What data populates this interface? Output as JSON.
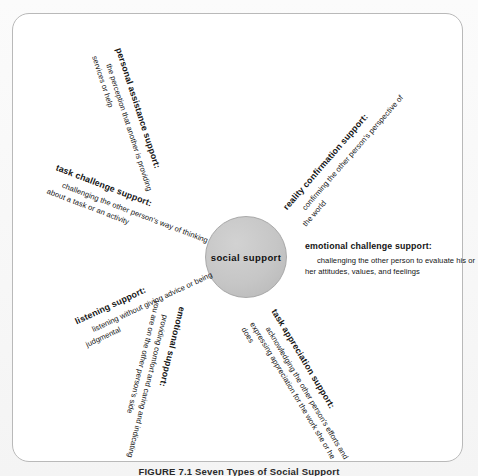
{
  "figure": {
    "center_label": "social support",
    "caption": "FIGURE 7.1  Seven Types of Social Support",
    "panel_border_color": "#b9b9b9",
    "hub_fill_color": "#c6c6c6",
    "text_color": "#141414"
  },
  "chart_data": {
    "type": "diagram",
    "layout": "radial hub-and-spoke",
    "title": "Seven Types of Social Support",
    "center": "social support",
    "spoke_count": 7,
    "spokes": [
      {
        "id": "personal-assistance",
        "term": "personal assistance support:",
        "description": "the perception that another is providing services or help",
        "angle_deg": 72,
        "position": "top"
      },
      {
        "id": "reality-confirmation",
        "term": "reality confirmation support:",
        "description": "confirming the other person's perspective of the world",
        "angle_deg": -49,
        "position": "upper-right"
      },
      {
        "id": "emotional-challenge",
        "term": "emotional challenge support:",
        "description": "challenging the other person to evaluate his or her attitudes, values, and feelings",
        "angle_deg": 0,
        "position": "right"
      },
      {
        "id": "task-appreciation",
        "term": "task appreciation support:",
        "description": "acknowledging the other person's efforts and expressing appreciation for the work she or he does",
        "angle_deg": 59,
        "position": "lower-right"
      },
      {
        "id": "emotional",
        "term": "emotional support:",
        "description": "providing comfort and caring and indicating you are on the other person's side",
        "angle_deg": 104,
        "position": "bottom"
      },
      {
        "id": "listening",
        "term": "listening support:",
        "description": "listening without giving advice or being judgmental",
        "angle_deg": -25,
        "position": "lower-left"
      },
      {
        "id": "task-challenge",
        "term": "task challenge support:",
        "description": "challenging the other person's way of thinking about a task or an activity",
        "angle_deg": 21,
        "position": "upper-left"
      }
    ]
  }
}
